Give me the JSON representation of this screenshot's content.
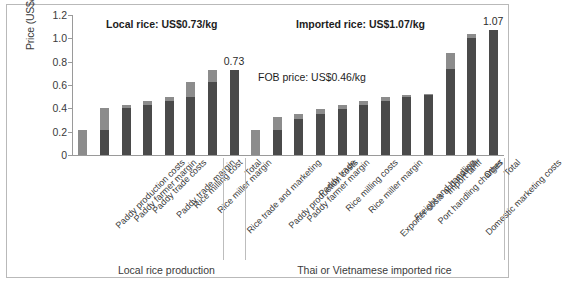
{
  "chart_data": {
    "type": "bar",
    "title": "",
    "xlabel": "",
    "ylabel": "Price (US$/kg)",
    "ylim": [
      0,
      1.2
    ],
    "ytick_labels": [
      "0",
      "0.2",
      "0.4",
      "0.6",
      "0.8",
      "1.0",
      "1.2"
    ],
    "ytick_values": [
      0,
      0.2,
      0.4,
      0.6,
      0.8,
      1.0,
      1.2
    ],
    "grid": false,
    "legend": "none",
    "stacked": true,
    "series": [
      {
        "name": "increment",
        "color": "#8c8c8c"
      },
      {
        "name": "cumulative-base",
        "color": "#4a4a4a"
      }
    ],
    "groups": [
      {
        "name": "Local rice production",
        "label": "Local rice production",
        "annotation": "Local rice: US$0.73/kg",
        "categories": [
          "Paddy production costs",
          "Paddy farmer margin",
          "Paddy trade costs",
          "Paddy trade  margin",
          "Rice milling cost",
          "Rice miller margin",
          "Rice trade and marketing",
          "Total"
        ],
        "base": [
          0.0,
          0.215,
          0.405,
          0.425,
          0.465,
          0.495,
          0.625,
          0.0
        ],
        "top": [
          0.215,
          0.405,
          0.425,
          0.465,
          0.495,
          0.625,
          0.725,
          0.73
        ],
        "values": [
          0.215,
          0.19,
          0.02,
          0.04,
          0.03,
          0.13,
          0.1,
          0.73
        ],
        "data_labels": [
          null,
          null,
          null,
          null,
          null,
          null,
          null,
          "0.73"
        ]
      },
      {
        "name": "Thai or Vietnamese imported rice",
        "label": "Thai or Vietnamese imported rice",
        "annotation": "Imported rice: US$1.07/kg",
        "categories": [
          "Paddy production costs",
          "Paddy farmer margin",
          "Paddy trade",
          "Rice milling costs",
          "Rice miller margin",
          "Exporter costs and margin",
          "Freight and handling",
          "Port handling charges",
          "Import tariff",
          "Domestic marketing costs",
          "Other",
          "Total"
        ],
        "base": [
          0.0,
          0.215,
          0.305,
          0.355,
          0.395,
          0.425,
          0.465,
          0.495,
          0.515,
          0.735,
          1.005,
          0.0
        ],
        "top": [
          0.215,
          0.325,
          0.355,
          0.395,
          0.425,
          0.465,
          0.495,
          0.515,
          0.525,
          0.875,
          1.035,
          1.07
        ],
        "values": [
          0.215,
          0.11,
          0.05,
          0.04,
          0.03,
          0.04,
          0.03,
          0.02,
          0.01,
          0.14,
          0.03,
          1.07
        ],
        "data_labels": [
          null,
          null,
          null,
          null,
          null,
          null,
          null,
          null,
          null,
          null,
          null,
          "1.07"
        ]
      }
    ],
    "annotations": [
      {
        "text": "Local rice: US$0.73/kg",
        "bold": true
      },
      {
        "text": "Imported rice: US$1.07/kg",
        "bold": true
      },
      {
        "text": "FOB price: US$0.46/kg",
        "bold": false
      }
    ]
  },
  "colors": {
    "bar_dark": "#4a4a4a",
    "bar_light": "#8c8c8c",
    "axis": "#9a9a9a",
    "text": "#3a3a3a",
    "frame": "#b9b9b9"
  }
}
